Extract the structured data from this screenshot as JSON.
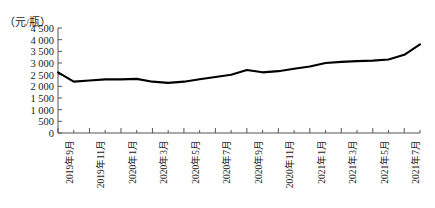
{
  "chart_data": {
    "type": "line",
    "title": "",
    "unit_label": "（元/瓶）",
    "ylabel": "",
    "xlabel": "",
    "ylim": [
      0,
      4500
    ],
    "yticks": [
      0,
      500,
      1000,
      1500,
      2000,
      2500,
      3000,
      3500,
      4000,
      4500
    ],
    "ytick_labels": [
      "0",
      "500",
      "1 000",
      "1 500",
      "2 000",
      "2 500",
      "3 000",
      "3 500",
      "4 000",
      "4 500"
    ],
    "grid": false,
    "legend": "none",
    "line_color": "#000000",
    "axis_color": "#555555",
    "x": [
      "2019年9月",
      "2019年10月",
      "2019年11月",
      "2019年12月",
      "2020年1月",
      "2020年2月",
      "2020年3月",
      "2020年4月",
      "2020年5月",
      "2020年6月",
      "2020年7月",
      "2020年8月",
      "2020年9月",
      "2020年10月",
      "2020年11月",
      "2020年12月",
      "2021年1月",
      "2021年2月",
      "2021年3月",
      "2021年4月",
      "2021年5月",
      "2021年6月",
      "2021年7月",
      "2021年8月"
    ],
    "xtick_labels_shown": [
      "2019年9月",
      "2019年11月",
      "2020年1月",
      "2020年3月",
      "2020年5月",
      "2020年7月",
      "2020年9月",
      "2020年11月",
      "2021年1月",
      "2021年3月",
      "2021年5月",
      "2021年7月"
    ],
    "values": [
      2600,
      2200,
      2250,
      2300,
      2300,
      2320,
      2200,
      2150,
      2200,
      2300,
      2400,
      2500,
      2700,
      2600,
      2650,
      2750,
      2850,
      3000,
      3050,
      3080,
      3100,
      3150,
      3350,
      3800
    ]
  }
}
